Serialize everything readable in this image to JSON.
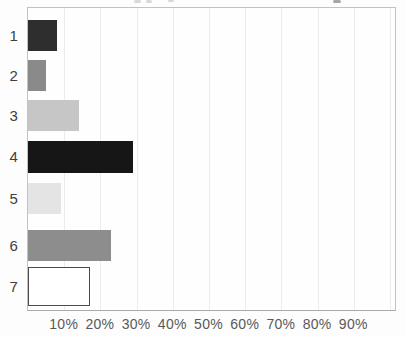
{
  "chart_data": {
    "type": "bar",
    "orientation": "horizontal",
    "title": "",
    "subtitle": "",
    "xlabel": "",
    "ylabel": "",
    "categories": [
      "1",
      "2",
      "3",
      "4",
      "5",
      "6",
      "7"
    ],
    "values": [
      8,
      5,
      14,
      29,
      9,
      23,
      17
    ],
    "value_unit": "%",
    "x_tick_labels": [
      "10%",
      "20%",
      "30%",
      "40%",
      "50%",
      "60%",
      "70%",
      "80%",
      "90%"
    ],
    "xlim": [
      0,
      102
    ],
    "grid": "vertical-light",
    "legend": "none",
    "bar_style": [
      {
        "fill": "#2e2e2e",
        "border": "none"
      },
      {
        "fill": "#8a8a8a",
        "border": "none"
      },
      {
        "fill": "#c6c6c6",
        "border": "none"
      },
      {
        "fill": "#161616",
        "border": "none"
      },
      {
        "fill": "#e4e4e4",
        "border": "none"
      },
      {
        "fill": "#8d8d8d",
        "border": "none"
      },
      {
        "fill": "#ffffff",
        "border": "#4a4a4a"
      }
    ],
    "colors": {
      "background": "#fdfdfd",
      "plot_border": "#c2c2c2",
      "axis_line": "#a9a9a9",
      "gridline": "#ececec",
      "tick_text": "#595959",
      "category_text": "#3f3f3f"
    }
  }
}
